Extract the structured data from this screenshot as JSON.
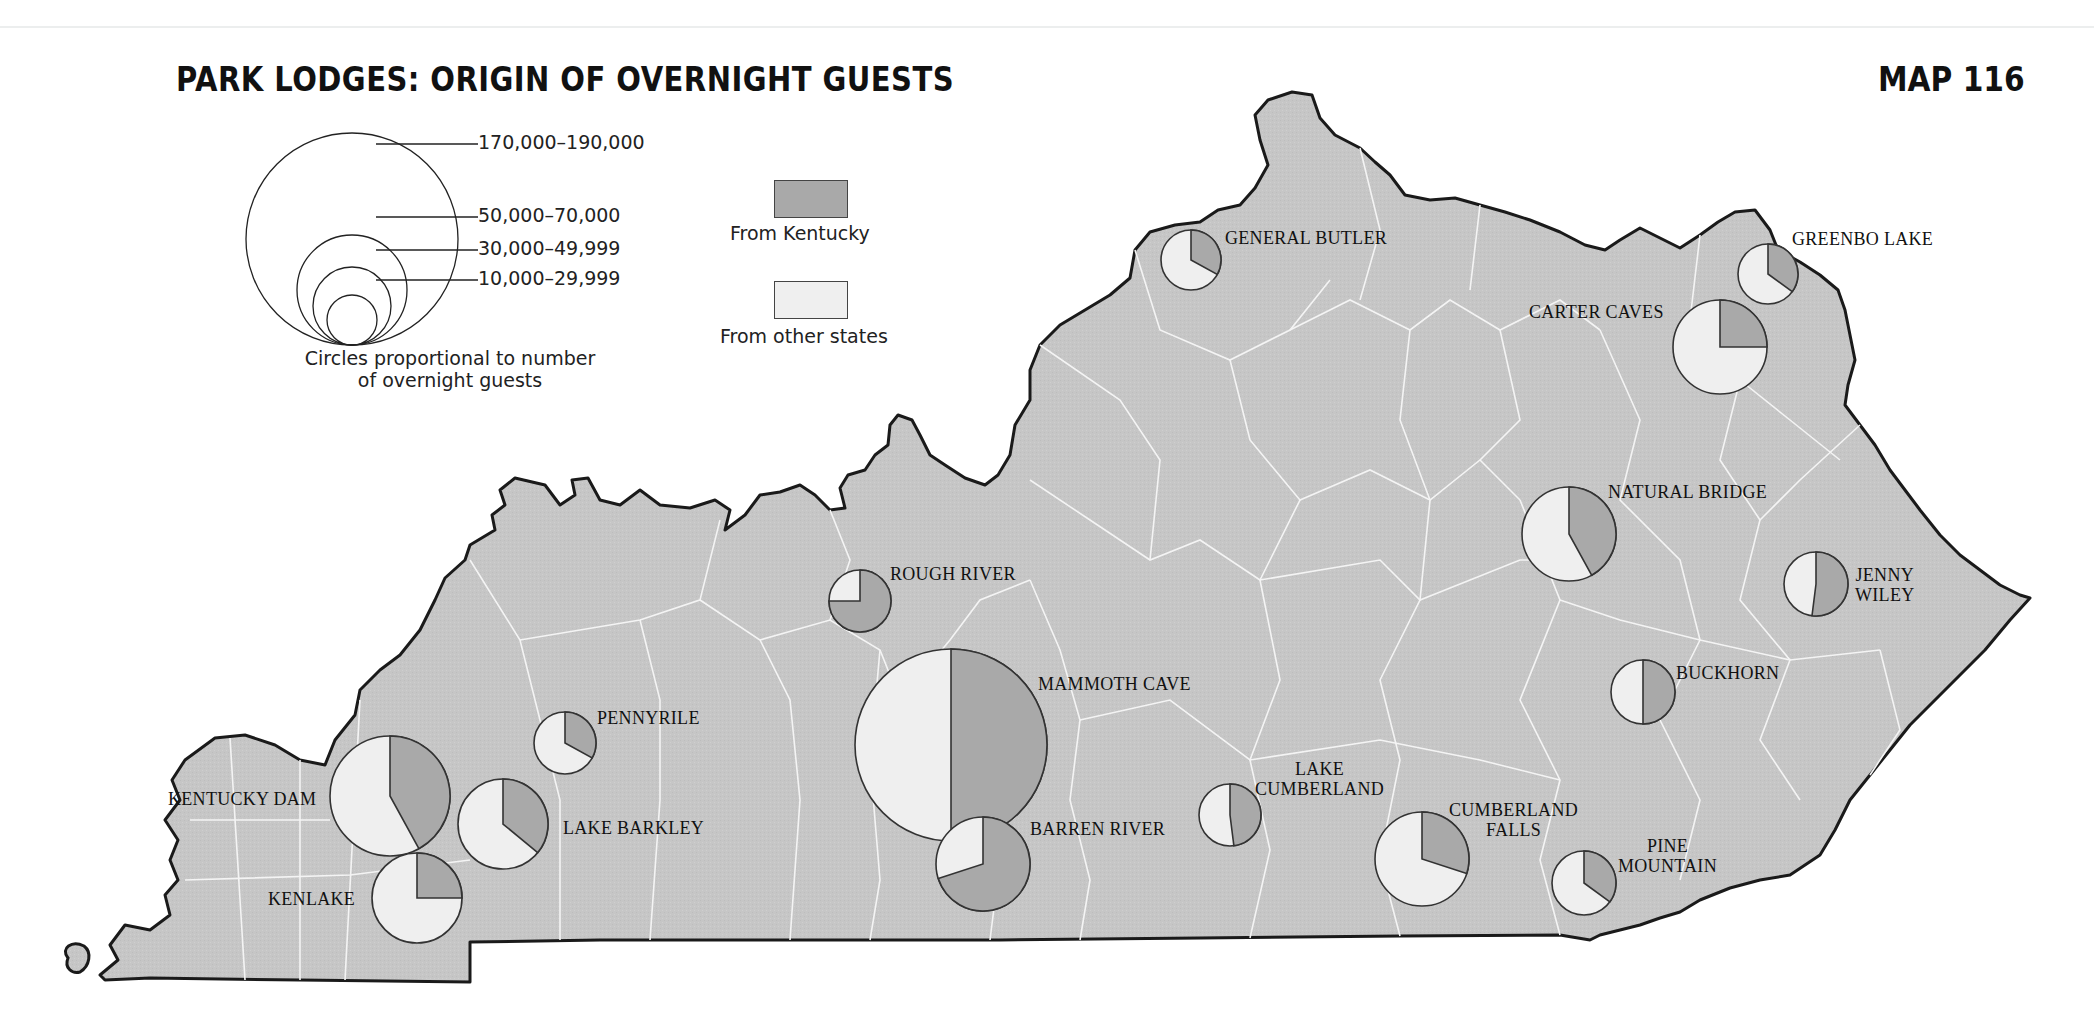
{
  "title": "PARK LODGES: ORIGIN OF OVERNIGHT GUESTS",
  "map_number": "MAP 116",
  "colors": {
    "from_kentucky": "#a9a9a9",
    "from_other_states": "#efefef",
    "state_fill": "#c6c6c6",
    "county_lines": "#ffffff",
    "outline": "#1a1a1a"
  },
  "legend": {
    "size_classes": [
      {
        "label": "170,000–190,000"
      },
      {
        "label": "50,000–70,000"
      },
      {
        "label": "30,000–49,999"
      },
      {
        "label": "10,000–29,999"
      }
    ],
    "caption_line1": "Circles proportional to number",
    "caption_line2": "of overnight guests",
    "from_kentucky": "From Kentucky",
    "from_other_states": "From other states"
  },
  "lodges": [
    {
      "name": "GENERAL BUTLER",
      "size_class": "10,000–29,999",
      "kentucky_share": 0.33
    },
    {
      "name": "GREENBO LAKE",
      "size_class": "10,000–29,999",
      "kentucky_share": 0.35
    },
    {
      "name": "CARTER CAVES",
      "size_class": "50,000–70,000",
      "kentucky_share": 0.25
    },
    {
      "name": "NATURAL BRIDGE",
      "size_class": "50,000–70,000",
      "kentucky_share": 0.42
    },
    {
      "name": "JENNY WILEY",
      "label_lines": [
        "JENNY",
        "WILEY"
      ],
      "size_class": "10,000–29,999",
      "kentucky_share": 0.52
    },
    {
      "name": "BUCKHORN",
      "size_class": "10,000–29,999",
      "kentucky_share": 0.5
    },
    {
      "name": "ROUGH RIVER",
      "size_class": "10,000–29,999",
      "kentucky_share": 0.75
    },
    {
      "name": "MAMMOTH CAVE",
      "size_class": "170,000–190,000",
      "kentucky_share": 0.5
    },
    {
      "name": "BARREN RIVER",
      "size_class": "50,000–70,000",
      "kentucky_share": 0.7
    },
    {
      "name": "PENNYRILE",
      "size_class": "10,000–29,999",
      "kentucky_share": 0.33
    },
    {
      "name": "KENTUCKY DAM",
      "size_class": "50,000–70,000",
      "kentucky_share": 0.42
    },
    {
      "name": "LAKE BARKLEY",
      "size_class": "30,000–49,999",
      "kentucky_share": 0.36
    },
    {
      "name": "KENLAKE",
      "size_class": "30,000–49,999",
      "kentucky_share": 0.25
    },
    {
      "name": "LAKE CUMBERLAND",
      "label_lines": [
        "LAKE",
        "CUMBERLAND"
      ],
      "size_class": "10,000–29,999",
      "kentucky_share": 0.48
    },
    {
      "name": "CUMBERLAND FALLS",
      "label_lines": [
        "CUMBERLAND",
        "FALLS"
      ],
      "size_class": "50,000–70,000",
      "kentucky_share": 0.3
    },
    {
      "name": "PINE MOUNTAIN",
      "label_lines": [
        "PINE",
        "MOUNTAIN"
      ],
      "size_class": "10,000–29,999",
      "kentucky_share": 0.35
    }
  ],
  "chart_data": {
    "type": "pie",
    "title": "PARK LODGES: ORIGIN OF OVERNIGHT GUESTS",
    "legend": [
      "From Kentucky",
      "From other states"
    ],
    "size_legend": [
      "170,000–190,000",
      "50,000–70,000",
      "30,000–49,999",
      "10,000–29,999"
    ],
    "series": [
      {
        "name": "General Butler",
        "from_kentucky_pct": 33,
        "from_other_states_pct": 67,
        "guests_class": "10,000–29,999"
      },
      {
        "name": "Greenbo Lake",
        "from_kentucky_pct": 35,
        "from_other_states_pct": 65,
        "guests_class": "10,000–29,999"
      },
      {
        "name": "Carter Caves",
        "from_kentucky_pct": 25,
        "from_other_states_pct": 75,
        "guests_class": "50,000–70,000"
      },
      {
        "name": "Natural Bridge",
        "from_kentucky_pct": 42,
        "from_other_states_pct": 58,
        "guests_class": "50,000–70,000"
      },
      {
        "name": "Jenny Wiley",
        "from_kentucky_pct": 52,
        "from_other_states_pct": 48,
        "guests_class": "10,000–29,999"
      },
      {
        "name": "Buckhorn",
        "from_kentucky_pct": 50,
        "from_other_states_pct": 50,
        "guests_class": "10,000–29,999"
      },
      {
        "name": "Rough River",
        "from_kentucky_pct": 75,
        "from_other_states_pct": 25,
        "guests_class": "10,000–29,999"
      },
      {
        "name": "Mammoth Cave",
        "from_kentucky_pct": 50,
        "from_other_states_pct": 50,
        "guests_class": "170,000–190,000"
      },
      {
        "name": "Barren River",
        "from_kentucky_pct": 70,
        "from_other_states_pct": 30,
        "guests_class": "50,000–70,000"
      },
      {
        "name": "Pennyrile",
        "from_kentucky_pct": 33,
        "from_other_states_pct": 67,
        "guests_class": "10,000–29,999"
      },
      {
        "name": "Kentucky Dam",
        "from_kentucky_pct": 42,
        "from_other_states_pct": 58,
        "guests_class": "50,000–70,000"
      },
      {
        "name": "Lake Barkley",
        "from_kentucky_pct": 36,
        "from_other_states_pct": 64,
        "guests_class": "30,000–49,999"
      },
      {
        "name": "Kenlake",
        "from_kentucky_pct": 25,
        "from_other_states_pct": 75,
        "guests_class": "30,000–49,999"
      },
      {
        "name": "Lake Cumberland",
        "from_kentucky_pct": 48,
        "from_other_states_pct": 52,
        "guests_class": "10,000–29,999"
      },
      {
        "name": "Cumberland Falls",
        "from_kentucky_pct": 30,
        "from_other_states_pct": 70,
        "guests_class": "50,000–70,000"
      },
      {
        "name": "Pine Mountain",
        "from_kentucky_pct": 35,
        "from_other_states_pct": 65,
        "guests_class": "10,000–29,999"
      }
    ]
  }
}
